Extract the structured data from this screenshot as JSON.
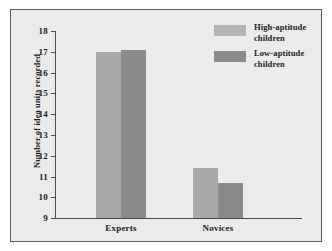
{
  "chart_data": {
    "type": "bar",
    "title": "",
    "xlabel": "",
    "ylabel": "Number of idea units recorded",
    "categories": [
      "Experts",
      "Novices"
    ],
    "series": [
      {
        "name": "High-aptitude children",
        "color": "#a9a9a9",
        "values": [
          17.0,
          11.4
        ]
      },
      {
        "name": "Low-aptitude children",
        "color": "#8a8a8a",
        "values": [
          17.1,
          10.7
        ]
      }
    ],
    "ylim": [
      8.1,
      18
    ],
    "yticks": [
      18,
      17,
      16,
      15,
      14,
      13,
      12,
      11,
      10,
      9
    ],
    "ytick_labels": [
      "18",
      "17",
      "16",
      "15",
      "14",
      "13",
      "12",
      "11",
      "10",
      "9"
    ],
    "grid": false,
    "legend_position": "top-right"
  },
  "legend": {
    "entries": [
      {
        "line1": "High-aptitude",
        "line2": "children",
        "swatch_color": "#b4b4b4"
      },
      {
        "line1": "Low-aptitude",
        "line2": "children",
        "swatch_color": "#8a8a8a"
      }
    ]
  },
  "colors": {
    "figure_background": "#ebebeb",
    "figure_border": "#5a5a5a",
    "axis": "#4a4a4a",
    "text": "#1c1c1c",
    "series_light": "#a9a9a9",
    "series_dark": "#8a8a8a"
  }
}
